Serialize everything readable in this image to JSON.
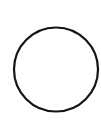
{
  "shape": {
    "type": "circle",
    "cx": 56,
    "cy": 69.5,
    "r": 42,
    "stroke": "#141414",
    "stroke_width": 2.2,
    "fill": "#ffffff"
  },
  "background": "#ffffff"
}
